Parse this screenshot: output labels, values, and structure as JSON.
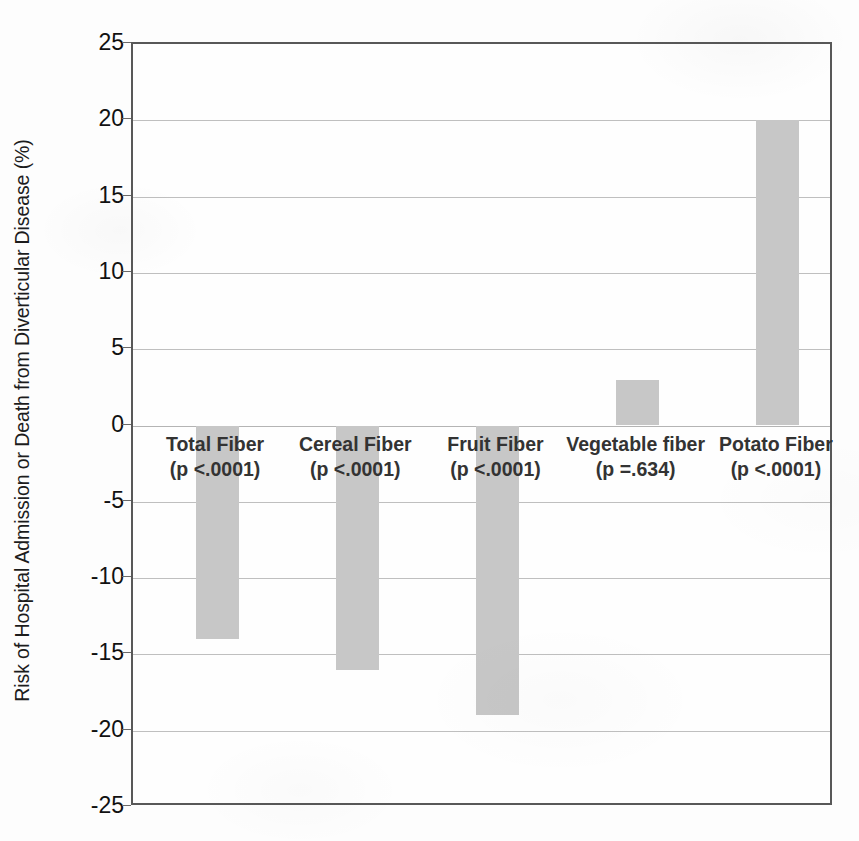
{
  "chart_data": {
    "type": "bar",
    "title": "",
    "xlabel": "",
    "ylabel": "Risk of Hospital Admission or Death from Diverticular Disease (%)",
    "ylim": [
      -25,
      25
    ],
    "yticks": [
      25,
      20,
      15,
      10,
      5,
      0,
      -5,
      -10,
      -15,
      -20,
      -25
    ],
    "ytick_labels": [
      "25",
      "20",
      "15",
      "10",
      "5",
      "0",
      "-5",
      "-10",
      "-15",
      "-20",
      "-25"
    ],
    "grid": true,
    "legend": false,
    "bar_color": "#c7c7c7",
    "categories": [
      "Total Fiber",
      "Cereal Fiber",
      "Fruit Fiber",
      "Vegetable fiber",
      "Potato Fiber"
    ],
    "values": [
      -14,
      -16,
      -19,
      3,
      20
    ],
    "annotations": [
      "(p <.0001)",
      "(p <.0001)",
      "(p <.0001)",
      "(p =.634)",
      "(p <.0001)"
    ],
    "bars": [
      {
        "category": "Total Fiber",
        "p_label": "(p <.0001)",
        "value": -14
      },
      {
        "category": "Cereal Fiber",
        "p_label": "(p <.0001)",
        "value": -16
      },
      {
        "category": "Fruit Fiber",
        "p_label": "(p <.0001)",
        "value": -19
      },
      {
        "category": "Vegetable fiber",
        "p_label": "(p =.634)",
        "value": 3
      },
      {
        "category": "Potato Fiber",
        "p_label": "(p <.0001)",
        "value": 20
      }
    ]
  }
}
